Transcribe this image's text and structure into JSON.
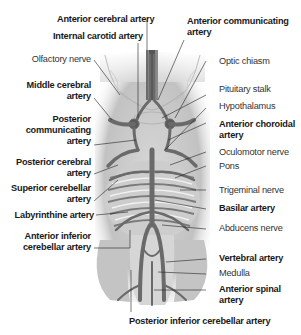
{
  "figure": {
    "labels_left": [
      {
        "id": "olfactory-nerve",
        "text": "Olfactory nerve",
        "bold": false
      },
      {
        "id": "middle-cerebral-artery",
        "line1": "Middle cerebral",
        "line2": "artery",
        "bold": true
      },
      {
        "id": "posterior-communicating-artery",
        "line1": "Posterior",
        "line2": "communicating",
        "line3": "artery",
        "bold": true
      },
      {
        "id": "posterior-cerebral-artery",
        "line1": "Posterior cerebral",
        "line2": "artery",
        "bold": true
      },
      {
        "id": "superior-cerebellar-artery",
        "line1": "Superior cerebellar",
        "line2": "artery",
        "bold": true
      },
      {
        "id": "labyrinthine-artery",
        "text": "Labyrinthine artery",
        "bold": true
      },
      {
        "id": "anterior-inferior-cerebellar-artery",
        "line1": "Anterior inferior",
        "line2": "cerebellar artery",
        "bold": true
      }
    ],
    "labels_top": [
      {
        "id": "anterior-cerebral-artery",
        "text": "Anterior cerebral artery",
        "bold": true
      },
      {
        "id": "internal-carotid-artery",
        "text": "Internal carotid artery",
        "bold": true
      },
      {
        "id": "anterior-communicating-artery",
        "line1": "Anterior communicating",
        "line2": "artery",
        "bold": true
      }
    ],
    "labels_right": [
      {
        "id": "optic-chiasm",
        "text": "Optic chiasm",
        "bold": false
      },
      {
        "id": "pituitary-stalk",
        "text": "Pituitary stalk",
        "bold": false
      },
      {
        "id": "hypothalamus",
        "text": "Hypothalamus",
        "bold": false
      },
      {
        "id": "anterior-choroidal-artery",
        "line1": "Anterior choroidal",
        "line2": "artery",
        "bold": true
      },
      {
        "id": "oculomotor-nerve",
        "text": "Oculomotor nerve",
        "bold": false
      },
      {
        "id": "pons",
        "text": "Pons",
        "bold": false
      },
      {
        "id": "trigeminal-nerve",
        "text": "Trigeminal nerve",
        "bold": false
      },
      {
        "id": "basilar-artery",
        "text": "Basilar artery",
        "bold": true
      },
      {
        "id": "abducens-nerve",
        "text": "Abducens nerve",
        "bold": false
      },
      {
        "id": "vertebral-artery",
        "text": "Vertebral artery",
        "bold": true
      },
      {
        "id": "medulla",
        "text": "Medulla",
        "bold": false
      },
      {
        "id": "anterior-spinal-artery",
        "line1": "Anterior spinal",
        "line2": "artery",
        "bold": true
      }
    ],
    "labels_bottom": [
      {
        "id": "posterior-inferior-cerebellar-artery",
        "text": "Posterior inferior cerebellar artery",
        "bold": true
      }
    ],
    "colors": {
      "artery": "#6e6e6e",
      "artery_dark": "#4a4a4a",
      "brain_fill": "#e6e6e6",
      "brain_shade": "#c8c8c8",
      "leader_line": "#222222"
    }
  }
}
